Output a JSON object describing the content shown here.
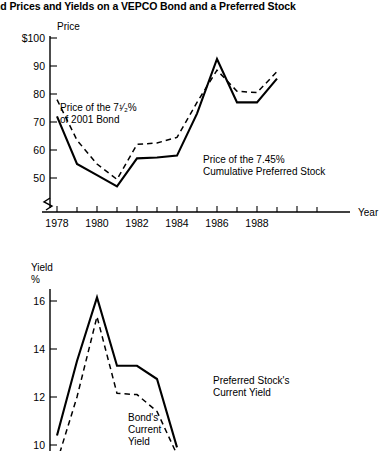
{
  "title": "nd Prices and Yields on a VEPCO Bond and a Preferred Stock",
  "chart_data": [
    {
      "type": "line",
      "id": "price",
      "title": "",
      "ylabel": "Price",
      "xlabel": "Year",
      "ylim": [
        40,
        100
      ],
      "xlim": [
        1977,
        1990
      ],
      "yticks": [
        50,
        60,
        70,
        80,
        90,
        100
      ],
      "yticklabels": [
        "50",
        "60",
        "70",
        "80",
        "90",
        "$100"
      ],
      "xticks": [
        1977,
        1978,
        1979,
        1980,
        1981,
        1982,
        1983,
        1984,
        1985,
        1986,
        1987,
        1988,
        1989,
        1990
      ],
      "xticklabels": [
        "",
        "1978",
        "",
        "1980",
        "",
        "1982",
        "",
        "1984",
        "",
        "1986",
        "",
        "1988",
        "",
        ""
      ],
      "grid": false,
      "legend": "inline-annotations",
      "axis_break": true,
      "x": [
        1978,
        1979,
        1980,
        1981,
        1982,
        1983,
        1984,
        1985,
        1986,
        1987,
        1988,
        1989
      ],
      "series": [
        {
          "name": "Price of the 7.45% Cumulative Preferred Stock",
          "style": "solid",
          "values": [
            72.0,
            55.0,
            51.0,
            47.0,
            57.0,
            57.3,
            58.0,
            73.0,
            92.5,
            77.0,
            77.0,
            85.5
          ]
        },
        {
          "name": "Price of the 7 1/2% of 2001 Bond",
          "style": "dashed",
          "values": [
            78.0,
            63.5,
            55.0,
            49.5,
            62.0,
            62.5,
            64.5,
            77.0,
            88.5,
            81.0,
            80.5,
            88.0
          ]
        }
      ],
      "annotations": [
        {
          "id": "bond-label",
          "line1": "Price of the 7¹⁄₂%",
          "line2": "of 2001 Bond"
        },
        {
          "id": "stock-label",
          "line1": "Price of the 7.45%",
          "line2": "Cumulative Preferred Stock"
        }
      ]
    },
    {
      "type": "line",
      "id": "yield",
      "title": "",
      "ylabel": "Yield %",
      "ylabel_line1": "Yield",
      "ylabel_line2": "%",
      "xlabel": "",
      "ylim": [
        9.2,
        17.2
      ],
      "yticks": [
        10,
        12,
        14,
        16
      ],
      "yticklabels": [
        "10",
        "12",
        "14",
        "16"
      ],
      "grid": false,
      "legend": "inline-annotations",
      "clipped_at_bottom": true,
      "x": [
        1978,
        1979,
        1980,
        1981,
        1982,
        1983,
        1984,
        1985,
        1986,
        1987,
        1988,
        1989
      ],
      "series": [
        {
          "name": "Preferred Stock's Current Yield",
          "style": "solid",
          "values": [
            10.4,
            13.5,
            16.15,
            13.3,
            13.3,
            12.75,
            9.9,
            null,
            null,
            null,
            null,
            null
          ]
        },
        {
          "name": "Bond's Current Yield",
          "style": "dashed",
          "values": [
            9.3,
            12.0,
            15.35,
            12.15,
            12.1,
            11.4,
            9.6,
            null,
            null,
            null,
            null,
            null
          ]
        }
      ],
      "annotations": [
        {
          "id": "pref-yield-label",
          "line1": "Preferred Stock's",
          "line2": "Current Yield"
        },
        {
          "id": "bond-yield-label",
          "line1": "Bond's",
          "line2": "Current",
          "line3": "Yield"
        }
      ]
    }
  ]
}
